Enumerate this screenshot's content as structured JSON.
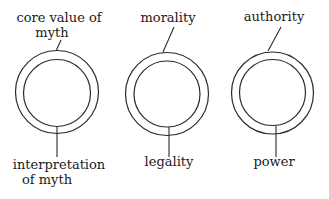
{
  "diagram": {
    "type": "concentric-circle-pairs",
    "items": [
      {
        "outer_label_lines": [
          "core value of",
          "myth"
        ],
        "inner_label_lines": [
          "interpretation",
          "of myth"
        ]
      },
      {
        "outer_label_lines": [
          "morality"
        ],
        "inner_label_lines": [
          "legality"
        ]
      },
      {
        "outer_label_lines": [
          "authority"
        ],
        "inner_label_lines": [
          "power"
        ]
      }
    ],
    "colors": {
      "line": "#2a2a2a",
      "text": "#1a1a1a",
      "background": "#ffffff"
    }
  }
}
